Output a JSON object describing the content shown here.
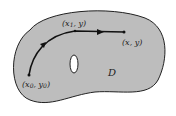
{
  "diagram": {
    "region_label": "D",
    "points": [
      {
        "id": "start",
        "label": "(x0, y0)"
      },
      {
        "id": "corner",
        "label": "(x1, y)"
      },
      {
        "id": "end",
        "label": "(x, y)"
      }
    ],
    "colors": {
      "region_fill": "#bdbdbd",
      "outline": "#222222",
      "path": "#111111",
      "hole_fill": "#ffffff"
    }
  }
}
